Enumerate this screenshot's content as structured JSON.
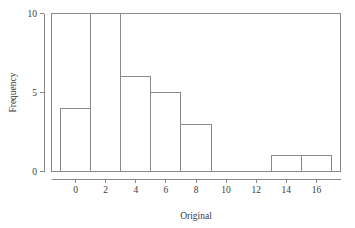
{
  "chart_data": {
    "type": "bar",
    "title": "",
    "subtitle": "",
    "xlabel": "Original",
    "ylabel": "Frequency",
    "xlim": [
      -1.6,
      17.6
    ],
    "ylim": [
      0,
      10.3
    ],
    "grid": false,
    "legend": null,
    "bin_width": 2,
    "bin_edges": [
      -1,
      1,
      3,
      5,
      7,
      9,
      11,
      13,
      15,
      17
    ],
    "categories": [
      "[-1,1)",
      "[1,3)",
      "[3,5)",
      "[5,7)",
      "[7,9)",
      "[9,11)",
      "[11,13)",
      "[13,15)",
      "[15,17)"
    ],
    "values": [
      4,
      10,
      6,
      5,
      3,
      0,
      0,
      1,
      1
    ],
    "bars": [
      {
        "x0": -1,
        "x1": 1,
        "height": 4
      },
      {
        "x0": 1,
        "x1": 3,
        "height": 10
      },
      {
        "x0": 3,
        "x1": 5,
        "height": 6
      },
      {
        "x0": 5,
        "x1": 7,
        "height": 5
      },
      {
        "x0": 7,
        "x1": 9,
        "height": 3
      },
      {
        "x0": 9,
        "x1": 11,
        "height": 0
      },
      {
        "x0": 11,
        "x1": 13,
        "height": 0
      },
      {
        "x0": 13,
        "x1": 15,
        "height": 1
      },
      {
        "x0": 15,
        "x1": 17,
        "height": 1
      }
    ],
    "xticks": [
      0,
      2,
      4,
      6,
      8,
      10,
      12,
      14,
      16
    ],
    "xtick_labels": [
      "0",
      "2",
      "4",
      "6",
      "8",
      "10",
      "12",
      "14",
      "16"
    ],
    "yticks": [
      0,
      5,
      10
    ],
    "ytick_labels": [
      "0",
      "5",
      "10"
    ],
    "total_count": 30,
    "colors": {
      "bar_fill": "#ffffff",
      "bar_stroke": "#8a8a8a",
      "axis": "#8a8a8a",
      "text": "#3a3a3a",
      "background": "#ffffff"
    }
  }
}
